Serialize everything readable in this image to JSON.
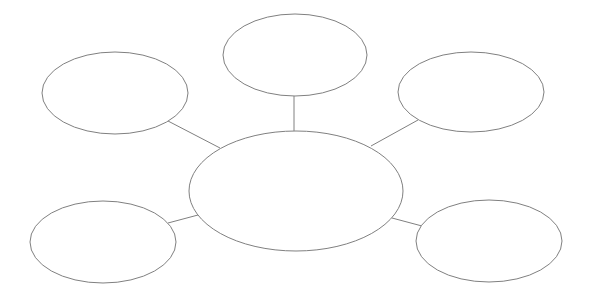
{
  "diagram": {
    "type": "spider-map",
    "stroke_color": "#808080",
    "background": "#ffffff",
    "center": {
      "id": "center",
      "cx": 296,
      "cy": 191,
      "rx": 107,
      "ry": 60,
      "label": ""
    },
    "nodes": [
      {
        "id": "top-left",
        "cx": 115,
        "cy": 93,
        "rx": 73,
        "ry": 41,
        "label": ""
      },
      {
        "id": "top-center",
        "cx": 295,
        "cy": 55,
        "rx": 72,
        "ry": 41,
        "label": ""
      },
      {
        "id": "top-right",
        "cx": 471,
        "cy": 92,
        "rx": 73,
        "ry": 40,
        "label": ""
      },
      {
        "id": "bottom-left",
        "cx": 103,
        "cy": 242,
        "rx": 73,
        "ry": 41,
        "label": ""
      },
      {
        "id": "bottom-right",
        "cx": 489,
        "cy": 241,
        "rx": 73,
        "ry": 41,
        "label": ""
      }
    ],
    "edges": [
      {
        "from": "top-left",
        "x1": 168,
        "y1": 121,
        "x2": 220,
        "y2": 148
      },
      {
        "from": "top-center",
        "x1": 294,
        "y1": 96,
        "x2": 294,
        "y2": 131
      },
      {
        "from": "top-right",
        "x1": 418,
        "y1": 120,
        "x2": 371,
        "y2": 146
      },
      {
        "from": "bottom-left",
        "x1": 168,
        "y1": 223,
        "x2": 198,
        "y2": 215
      },
      {
        "from": "bottom-right",
        "x1": 392,
        "y1": 218,
        "x2": 422,
        "y2": 226
      }
    ]
  }
}
